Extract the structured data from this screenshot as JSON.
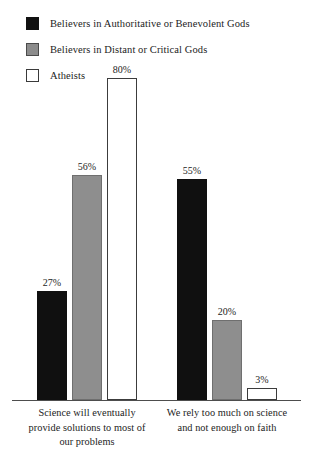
{
  "legend": {
    "items": [
      {
        "label": "Believers in Authoritative or Benevolent Gods",
        "swatch": "black-square-icon",
        "color": "#111111"
      },
      {
        "label": "Believers in Distant or Critical Gods",
        "swatch": "gray-square-icon",
        "color": "#8c8c8c"
      },
      {
        "label": "Atheists",
        "swatch": "white-square-icon",
        "color": "#ffffff"
      }
    ]
  },
  "caption": {
    "cropped_text": ""
  },
  "chart_data": {
    "type": "bar",
    "title": "",
    "xlabel": "",
    "ylabel": "",
    "ylim": [
      0,
      85
    ],
    "grid": false,
    "legend_position": "top-left",
    "value_label_suffix": "%",
    "categories": [
      "Science will eventually provide solutions to most of our problems",
      "We rely too much on science and not enough on faith"
    ],
    "category_lines": [
      [
        "Science will eventually",
        "provide solutions to most of",
        "our problems"
      ],
      [
        "We rely too much on science",
        "and not enough on faith"
      ]
    ],
    "series": [
      {
        "name": "Believers in Authoritative or Benevolent Gods",
        "color": "#111111",
        "style": "black",
        "values": [
          27,
          55
        ],
        "labels": [
          "27%",
          "55%"
        ]
      },
      {
        "name": "Believers in Distant or Critical Gods",
        "color": "#8e8e8e",
        "style": "gray",
        "values": [
          56,
          20
        ],
        "labels": [
          "56%",
          "20%"
        ]
      },
      {
        "name": "Atheists",
        "color": "#ffffff",
        "style": "white",
        "values": [
          80,
          3
        ],
        "labels": [
          "80%",
          "3%"
        ]
      }
    ]
  }
}
